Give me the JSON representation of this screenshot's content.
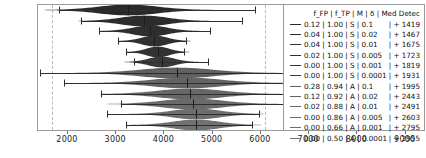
{
  "chart_data": {
    "type": "violin",
    "title": "",
    "xlabel": "",
    "ylabel": "",
    "xlim": [
      1400,
      9400
    ],
    "xticks": [
      2000,
      3000,
      4000,
      5000,
      6000,
      7000,
      8000,
      9000
    ],
    "xticklabels": [
      "2000",
      "3000",
      "4000",
      "5000",
      "6000",
      "7000",
      "8000",
      "9000"
    ],
    "grid": true,
    "gridlines_x": [
      1700,
      6100
    ],
    "legend_position": "right",
    "colors": {
      "violin_dark": "#1c1c1c",
      "violin_light": "#8d8d8d",
      "errorbar": "#2e2e2e",
      "frame": "#9a9a9a",
      "grid": "#b9b9b9"
    },
    "series": [
      {
        "name": "0.12 | 1.00 | S | 0.1",
        "f_FP": 0.12,
        "f_TP": 1.0,
        "M": "S",
        "delta": "0.1",
        "med_detec": 1419,
        "median": 3270,
        "ci_low": 1830,
        "ci_high": 5900,
        "spread": 1850,
        "shade": 0.1
      },
      {
        "name": "0.04 | 1.00 | S | 0.02",
        "f_FP": 0.04,
        "f_TP": 1.0,
        "M": "S",
        "delta": "0.02",
        "med_detec": 1467,
        "median": 3590,
        "ci_low": 2290,
        "ci_high": 5620,
        "spread": 1450,
        "shade": 0.12
      },
      {
        "name": "0.04 | 1.00 | S | 0.01",
        "f_FP": 0.04,
        "f_TP": 1.0,
        "M": "S",
        "delta": "0.01",
        "med_detec": 1675,
        "median": 3720,
        "ci_low": 2660,
        "ci_high": 4960,
        "spread": 1080,
        "shade": 0.14
      },
      {
        "name": "0.02 | 1.00 | S | 0.005",
        "f_FP": 0.02,
        "f_TP": 1.0,
        "M": "S",
        "delta": "0.005",
        "med_detec": 1723,
        "median": 3810,
        "ci_low": 3060,
        "ci_high": 4470,
        "spread": 800,
        "shade": 0.16
      },
      {
        "name": "0.00 | 1.00 | S | 0.001",
        "f_FP": 0.0,
        "f_TP": 1.0,
        "M": "S",
        "delta": "0.001",
        "med_detec": 1819,
        "median": 3880,
        "ci_low": 3230,
        "ci_high": 4420,
        "spread": 700,
        "shade": 0.18
      },
      {
        "name": "0.00 | 1.00 | S | 0.0001",
        "f_FP": 0.0,
        "f_TP": 1.0,
        "M": "S",
        "delta": "0.0001",
        "med_detec": 1931,
        "median": 3960,
        "ci_low": 3380,
        "ci_high": 4930,
        "spread": 820,
        "shade": 0.22
      },
      {
        "name": "0.28 | 0.94 | A | 0.1",
        "f_FP": 0.28,
        "f_TP": 0.94,
        "M": "A",
        "delta": "0.1",
        "med_detec": 1995,
        "median": 4280,
        "ci_low": 1450,
        "ci_high": 7020,
        "spread": 2250,
        "shade": 0.52
      },
      {
        "name": "0.12 | 0.92 | A | 0.02",
        "f_FP": 0.12,
        "f_TP": 0.92,
        "M": "A",
        "delta": "0.02",
        "med_detec": 2443,
        "median": 4490,
        "ci_low": 1930,
        "ci_high": 7020,
        "spread": 2150,
        "shade": 0.55
      },
      {
        "name": "0.02 | 0.88 | A | 0.01",
        "f_FP": 0.02,
        "f_TP": 0.88,
        "M": "A",
        "delta": "0.01",
        "med_detec": 2491,
        "median": 4560,
        "ci_low": 2700,
        "ci_high": 7000,
        "spread": 2000,
        "shade": 0.58
      },
      {
        "name": "0.00 | 0.86 | A | 0.005",
        "f_FP": 0.0,
        "f_TP": 0.86,
        "M": "A",
        "delta": "0.005",
        "med_detec": 2603,
        "median": 4610,
        "ci_low": 3110,
        "ci_high": 7030,
        "spread": 1900,
        "shade": 0.6
      },
      {
        "name": "0.00 | 0.66 | A | 0.001",
        "f_FP": 0.0,
        "f_TP": 0.66,
        "M": "A",
        "delta": "0.001",
        "med_detec": 2795,
        "median": 4680,
        "ci_low": 2840,
        "ci_high": 5980,
        "spread": 1500,
        "shade": 0.62
      },
      {
        "name": "0.00 | 0.50 | A | 0.0001",
        "f_FP": 0.0,
        "f_TP": 0.5,
        "M": "A",
        "delta": "0.0001",
        "med_detec": 2955,
        "median": 4680,
        "ci_low": 3220,
        "ci_high": 5830,
        "spread": 1450,
        "shade": 0.65
      }
    ]
  },
  "legend": {
    "header": "f_FP  | f_TP | M | δ | Med Detec",
    "rows": [
      {
        "label": "0.12 | 1.00 | S | 0.1",
        "med": "| + 1419"
      },
      {
        "label": "0.04 | 1.00 | S | 0.02",
        "med": "| + 1467"
      },
      {
        "label": "0.04 | 1.00 | S | 0.01",
        "med": "| + 1675"
      },
      {
        "label": "0.02 | 1.00 | S | 0.005",
        "med": "| + 1723"
      },
      {
        "label": "0.00 | 1.00 | S | 0.001",
        "med": "| + 1819"
      },
      {
        "label": "0.00 | 1.00 | S | 0.0001",
        "med": "| + 1931"
      },
      {
        "label": "0.28 | 0.94 | A | 0.1",
        "med": "| + 1995"
      },
      {
        "label": "0.12 | 0.92 | A | 0.02",
        "med": "| + 2443"
      },
      {
        "label": "0.02 | 0.88 | A | 0.01",
        "med": "| + 2491"
      },
      {
        "label": "0.00 | 0.86 | A | 0.005",
        "med": "| + 2603"
      },
      {
        "label": "0.00 | 0.66 | A | 0.001",
        "med": "| + 2795"
      },
      {
        "label": "0.00 | 0.50 | A | 0.0001",
        "med": "| + 2955"
      }
    ]
  }
}
